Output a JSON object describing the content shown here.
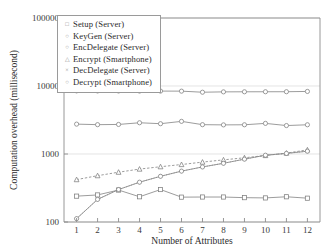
{
  "chart_data": {
    "type": "line",
    "title": "",
    "xlabel": "Number of Attributes",
    "ylabel": "Computation overhead (millisecond)",
    "xlim": [
      0.4,
      12.6
    ],
    "ylim": [
      100,
      100000
    ],
    "yscale": "log",
    "grid": true,
    "legend_position": "upper-left",
    "x": [
      1,
      2,
      3,
      4,
      5,
      6,
      7,
      8,
      9,
      10,
      11,
      12
    ],
    "xticks": [
      "1",
      "2",
      "3",
      "4",
      "5",
      "6",
      "7",
      "8",
      "9",
      "10",
      "11",
      "12"
    ],
    "yticks": [
      "100",
      "1000",
      "10000",
      "100000"
    ],
    "series": [
      {
        "name": "Setup (Server)",
        "marker": "square-open",
        "linestyle": "solid",
        "values": [
          240,
          250,
          295,
          235,
          300,
          232,
          233,
          233,
          228,
          226,
          235,
          224
        ]
      },
      {
        "name": "KeyGen (Server)",
        "marker": "circle-open",
        "linestyle": "solid",
        "values": [
          2750,
          2700,
          2720,
          2880,
          2790,
          3020,
          2700,
          2680,
          2690,
          2820,
          2620,
          2690
        ]
      },
      {
        "name": "EncDelegate (Server)",
        "marker": "circle-open",
        "linestyle": "solid",
        "values": [
          8480,
          8460,
          8450,
          8430,
          8420,
          8400,
          8100,
          8200,
          8220,
          8230,
          8240,
          8320
        ]
      },
      {
        "name": "Encrypt (Smartphone)",
        "marker": "triangle-open",
        "linestyle": "dashed",
        "values": [
          420,
          480,
          540,
          600,
          650,
          700,
          760,
          820,
          880,
          950,
          1030,
          1150
        ]
      },
      {
        "name": "DecDelegate (Server)",
        "marker": "plus",
        "linestyle": "dotted",
        "values": [
          112,
          215,
          300,
          385,
          470,
          560,
          645,
          730,
          840,
          960,
          1020,
          1100
        ]
      },
      {
        "name": "Decrypt (Smartphone)",
        "marker": "circle-open",
        "linestyle": "solid",
        "values": [
          112,
          215,
          300,
          385,
          470,
          560,
          645,
          730,
          840,
          960,
          1020,
          1100
        ]
      }
    ]
  },
  "legend": {
    "items": [
      {
        "label": "Setup (Server)",
        "glyph": "□"
      },
      {
        "label": "KeyGen (Server)",
        "glyph": "○"
      },
      {
        "label": "EncDelegate (Server)",
        "glyph": "○"
      },
      {
        "label": "Encrypt (Smartphone)",
        "glyph": "△"
      },
      {
        "label": "DecDelegate (Server)",
        "glyph": "×"
      },
      {
        "label": "Decrypt (Smartphone)",
        "glyph": "○"
      }
    ]
  }
}
